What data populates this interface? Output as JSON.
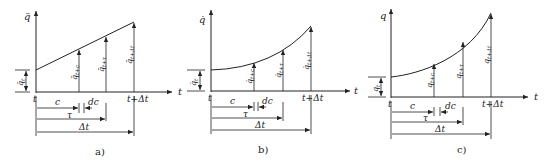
{
  "figure": {
    "panels": [
      {
        "id": "a",
        "caption": "a)",
        "y_axis_label": "q̈",
        "x_axis_label": "t",
        "origin_label": "t",
        "end_label": "t+Δt",
        "initial_value_label": "q̈",
        "initial_value_sub": "t",
        "ordinates": [
          {
            "label": "q̈",
            "sub": "t+c"
          },
          {
            "label": "q̈",
            "sub": "t+τ"
          },
          {
            "label": "q̈",
            "sub": "t+Δt"
          }
        ],
        "dims": {
          "c": "c",
          "dc": "dc",
          "tau": "τ",
          "dt": "Δt"
        },
        "curve_shape": "linear"
      },
      {
        "id": "b",
        "caption": "b)",
        "y_axis_label": "q̇",
        "x_axis_label": "t",
        "origin_label": "t",
        "end_label": "t+Δt",
        "initial_value_label": "q̇",
        "initial_value_sub": "t",
        "ordinates": [
          {
            "label": "q̇",
            "sub": "t+c"
          },
          {
            "label": "q̇",
            "sub": "t+τ"
          },
          {
            "label": "q̇",
            "sub": "t+Δt"
          }
        ],
        "dims": {
          "c": "c",
          "dc": "dc",
          "tau": "τ",
          "dt": "Δt"
        },
        "curve_shape": "quadratic"
      },
      {
        "id": "c",
        "caption": "c)",
        "y_axis_label": "q",
        "x_axis_label": "t",
        "origin_label": "t",
        "end_label": "t+Δt",
        "initial_value_label": "q",
        "initial_value_sub": "t",
        "ordinates": [
          {
            "label": "q",
            "sub": "t+c"
          },
          {
            "label": "q",
            "sub": "t+τ"
          },
          {
            "label": "q",
            "sub": "t+Δt"
          }
        ],
        "dims": {
          "c": "c",
          "dc": "dc",
          "tau": "τ",
          "dt": "Δt"
        },
        "curve_shape": "cubic"
      }
    ]
  }
}
